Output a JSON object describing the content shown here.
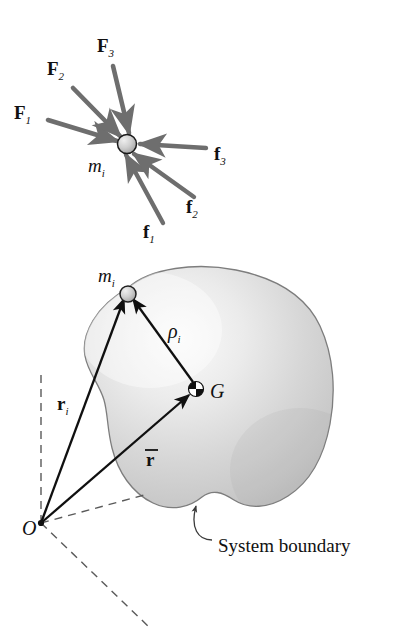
{
  "figure": {
    "background_color": "#ffffff",
    "ink_color": "#111111",
    "force_vector_color": "#6e6e6e",
    "position_vector_color": "#101010",
    "body_fill_color": "#d2d2d2",
    "body_highlight_color": "#f2f2f2",
    "body_edge_color": "#7d7d7d",
    "dashed_axis_color": "#5a5a5a",
    "particle_fill_color": "#c8c8c8",
    "particle_edge_color": "#1a1a1a"
  },
  "top_diagram": {
    "name": "free-body diagram of representative particle",
    "particle": {
      "label": "m",
      "subscript": "i",
      "cx": 127,
      "cy": 144,
      "r": 9.5
    },
    "external_forces": [
      {
        "id": "F1",
        "label": "F",
        "subscript": "1",
        "label_x": 14,
        "label_y": 119,
        "tail_x": 48,
        "tail_y": 120,
        "head_x": 117,
        "head_y": 141,
        "kind": "external"
      },
      {
        "id": "F2",
        "label": "F",
        "subscript": "2",
        "label_x": 47,
        "label_y": 75,
        "tail_x": 73,
        "tail_y": 88,
        "head_x": 120,
        "head_y": 136,
        "kind": "external"
      },
      {
        "id": "F3",
        "label": "F",
        "subscript": "3",
        "label_x": 97,
        "label_y": 52,
        "tail_x": 113,
        "tail_y": 66,
        "head_x": 129,
        "head_y": 133,
        "kind": "external"
      }
    ],
    "internal_forces": [
      {
        "id": "f1",
        "label": "f",
        "subscript": "1",
        "label_x": 143,
        "label_y": 238,
        "tail_x": 163,
        "tail_y": 223,
        "head_x": 126,
        "head_y": 155,
        "kind": "internal"
      },
      {
        "id": "f2",
        "label": "f",
        "subscript": "2",
        "label_x": 186,
        "label_y": 213,
        "tail_x": 194,
        "tail_y": 197,
        "head_x": 134,
        "head_y": 154,
        "kind": "internal"
      },
      {
        "id": "f3",
        "label": "f",
        "subscript": "3",
        "label_x": 214,
        "label_y": 160,
        "tail_x": 206,
        "tail_y": 148,
        "head_x": 140,
        "head_y": 144,
        "kind": "internal"
      }
    ]
  },
  "bottom_diagram": {
    "name": "system of particles with mass center",
    "origin": {
      "label": "O",
      "x": 41,
      "y": 523,
      "label_x": 22,
      "label_y": 534
    },
    "particle": {
      "label": "m",
      "subscript": "i",
      "cx": 128,
      "cy": 294,
      "r": 8,
      "label_x": 98,
      "label_y": 276
    },
    "mass_center": {
      "label": "G",
      "cx": 196,
      "cy": 389,
      "r": 7.5,
      "label_x": 210,
      "label_y": 397
    },
    "vectors": [
      {
        "id": "r_i",
        "label": "r",
        "subscript": "i",
        "overbar": false,
        "tail_x": 41,
        "tail_y": 523,
        "head_x": 124,
        "head_y": 299,
        "label_x": 57,
        "label_y": 403
      },
      {
        "id": "r_bar",
        "label": "r",
        "subscript": "",
        "overbar": true,
        "tail_x": 41,
        "tail_y": 523,
        "head_x": 189,
        "head_y": 395,
        "label_x": 146,
        "label_y": 458
      },
      {
        "id": "rho_i",
        "label": "ρ",
        "subscript": "i",
        "overbar": false,
        "tail_x": 193,
        "tail_y": 382,
        "head_x": 133,
        "head_y": 299,
        "label_x": 168,
        "label_y": 330
      }
    ],
    "axes": [
      {
        "id": "axis-vertical",
        "x1": 41,
        "y1": 523,
        "x2": 41,
        "y2": 370
      },
      {
        "id": "axis-upper-right",
        "x1": 41,
        "y1": 523,
        "x2": 148,
        "y2": 494
      },
      {
        "id": "axis-lower-right",
        "x1": 41,
        "y1": 523,
        "x2": 148,
        "y2": 626
      }
    ],
    "annotation": {
      "text": "System boundary",
      "text_x": 218,
      "text_y": 546,
      "leader_from_x": 212,
      "leader_from_y": 540,
      "leader_to_x": 196,
      "leader_to_y": 504
    }
  }
}
